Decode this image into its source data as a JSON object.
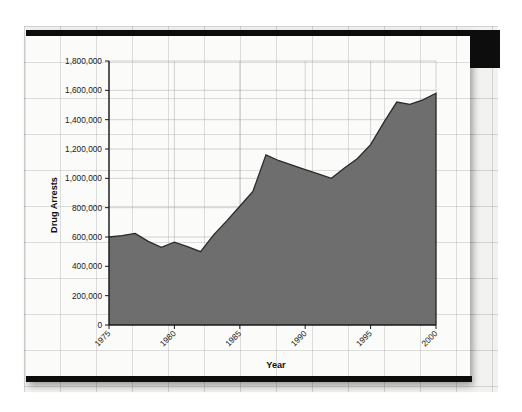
{
  "figure": {
    "background_color": "#fbfbfa",
    "page_grid_color": "#969696",
    "series_fill_color": "#6e6e6e",
    "series_line_color": "#2a2a2a",
    "axis_color": "#1a1a1a"
  },
  "chart_data": {
    "type": "area",
    "title": "",
    "xlabel": "Year",
    "ylabel": "Drug Arrests",
    "xlim": [
      1975,
      2000
    ],
    "ylim": [
      0,
      1800000
    ],
    "grid": true,
    "legend_position": "none",
    "y_ticks": [
      0,
      200000,
      400000,
      600000,
      800000,
      1000000,
      1200000,
      1400000,
      1600000,
      1800000
    ],
    "y_tick_labels": [
      "0",
      "200,000",
      "400,000",
      "600,000",
      "800,000",
      "1,000,000",
      "1,200,000",
      "1,400,000",
      "1,600,000",
      "1,800,000"
    ],
    "x_ticks": [
      1975,
      1980,
      1985,
      1990,
      1995,
      2000
    ],
    "x_tick_labels": [
      "1975",
      "1980",
      "1985",
      "1990",
      "1995",
      "2000"
    ],
    "series": [
      {
        "name": "Drug Arrests",
        "x": [
          1975,
          1976,
          1977,
          1978,
          1979,
          1980,
          1981,
          1982,
          1983,
          1984,
          1985,
          1986,
          1987,
          1988,
          1989,
          1990,
          1991,
          1992,
          1993,
          1994,
          1995,
          1996,
          1997,
          1998,
          1999,
          2000
        ],
        "values": [
          600000,
          610000,
          625000,
          570000,
          530000,
          565000,
          535000,
          500000,
          615000,
          710000,
          810000,
          910000,
          1160000,
          1120000,
          1090000,
          1060000,
          1030000,
          1000000,
          1070000,
          1135000,
          1230000,
          1380000,
          1520000,
          1505000,
          1535000,
          1580000
        ]
      }
    ]
  },
  "labels": {
    "y_axis_title": "Drug Arrests",
    "x_axis_title": "Year"
  }
}
